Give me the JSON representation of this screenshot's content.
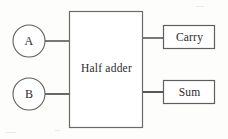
{
  "diagram": {
    "kind": "block-diagram",
    "stroke_color": "#575755",
    "text_color": "#2b2b2b",
    "background_color": "#fdfdfc",
    "inputs": [
      {
        "id": "a",
        "label": "A",
        "shape": "circle",
        "cx": 29,
        "cy": 41,
        "r": 16
      },
      {
        "id": "b",
        "label": "B",
        "shape": "circle",
        "cx": 29,
        "cy": 94,
        "r": 16
      }
    ],
    "block": {
      "id": "half-adder",
      "label": "Half adder",
      "shape": "rectangle",
      "x": 69,
      "y": 11,
      "width": 74,
      "height": 116
    },
    "outputs": [
      {
        "id": "carry",
        "label": "Carry",
        "shape": "rectangle",
        "x": 163,
        "y": 25,
        "width": 52,
        "height": 24
      },
      {
        "id": "sum",
        "label": "Sum",
        "shape": "rectangle",
        "x": 163,
        "y": 80,
        "width": 52,
        "height": 24
      }
    ],
    "connections": [
      {
        "id": "a-to-block",
        "from": "a",
        "to": "half-adder",
        "x1": 45,
        "y1": 41,
        "x2": 69,
        "y2": 41
      },
      {
        "id": "b-to-block",
        "from": "b",
        "to": "half-adder",
        "x1": 45,
        "y1": 94,
        "x2": 69,
        "y2": 94
      },
      {
        "id": "block-to-carry",
        "from": "half-adder",
        "to": "carry",
        "x1": 143,
        "y1": 38,
        "x2": 163,
        "y2": 38
      },
      {
        "id": "block-to-sum",
        "from": "half-adder",
        "to": "sum",
        "x1": 143,
        "y1": 92,
        "x2": 163,
        "y2": 92
      }
    ]
  }
}
